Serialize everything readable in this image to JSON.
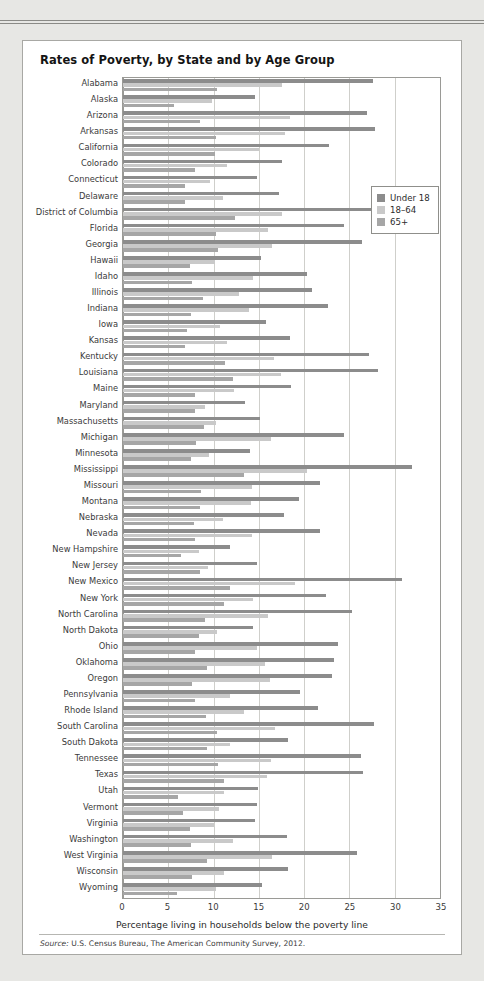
{
  "page": {
    "header_fragment": "",
    "card_title": "Rates of Poverty, by State and by Age Group",
    "source_prefix": "Source:",
    "source_text": " U.S. Census Bureau, The American Community Survey, 2012."
  },
  "legend": {
    "position": "top-right-inside",
    "items": [
      {
        "label": "Under 18",
        "color": "#8c8c8c",
        "key": "u18"
      },
      {
        "label": "18–64",
        "color": "#c9c9c9",
        "key": "a1864"
      },
      {
        "label": "65+",
        "color": "#a6a6a6",
        "key": "a65"
      }
    ]
  },
  "chart_data": {
    "type": "bar",
    "orientation": "horizontal",
    "title": "Rates of Poverty, by State and by Age Group",
    "xlabel": "Percentage living in households below the poverty line",
    "ylabel": "",
    "xlim": [
      0,
      35
    ],
    "xticks": [
      0,
      5,
      10,
      15,
      20,
      25,
      30,
      35
    ],
    "xtick_labels": [
      "0",
      "5",
      "10",
      "15",
      "20",
      "25",
      "30",
      "35"
    ],
    "grid": "vertical",
    "legend_position": "upper right",
    "categories": [
      "Alabama",
      "Alaska",
      "Arizona",
      "Arkansas",
      "California",
      "Colorado",
      "Connecticut",
      "Delaware",
      "District of Columbia",
      "Florida",
      "Georgia",
      "Hawaii",
      "Idaho",
      "Illinois",
      "Indiana",
      "Iowa",
      "Kansas",
      "Kentucky",
      "Louisiana",
      "Maine",
      "Maryland",
      "Massachusetts",
      "Michigan",
      "Minnesota",
      "Mississippi",
      "Missouri",
      "Montana",
      "Nebraska",
      "Nevada",
      "New Hampshire",
      "New Jersey",
      "New Mexico",
      "New York",
      "North Carolina",
      "North Dakota",
      "Ohio",
      "Oklahoma",
      "Oregon",
      "Pennsylvania",
      "Rhode Island",
      "South Carolina",
      "South Dakota",
      "Tennessee",
      "Texas",
      "Utah",
      "Vermont",
      "Virginia",
      "Washington",
      "West Virginia",
      "Wisconsin",
      "Wyoming"
    ],
    "series": [
      {
        "name": "Under 18",
        "color": "#8c8c8c",
        "values": [
          27.6,
          14.6,
          26.9,
          27.8,
          22.7,
          17.5,
          14.8,
          17.2,
          30.2,
          24.4,
          26.4,
          15.2,
          20.3,
          20.9,
          22.6,
          15.8,
          18.4,
          27.2,
          28.1,
          18.5,
          13.5,
          15.1,
          24.4,
          14.0,
          31.9,
          21.8,
          19.4,
          17.8,
          21.8,
          11.8,
          14.8,
          30.8,
          22.4,
          25.3,
          14.3,
          23.7,
          23.3,
          23.1,
          19.5,
          21.5,
          27.7,
          18.2,
          26.3,
          26.5,
          14.9,
          14.8,
          14.6,
          18.1,
          25.8,
          18.2,
          15.4
        ]
      },
      {
        "name": "18–64",
        "color": "#c9c9c9",
        "values": [
          17.5,
          9.8,
          18.4,
          17.9,
          15.0,
          11.5,
          9.6,
          11.0,
          17.5,
          16.0,
          16.5,
          10.2,
          14.3,
          12.8,
          13.9,
          10.7,
          11.5,
          16.7,
          17.4,
          12.3,
          9.1,
          10.3,
          16.3,
          9.5,
          20.3,
          14.2,
          14.1,
          11.0,
          14.2,
          8.4,
          9.4,
          19.0,
          14.3,
          16.0,
          10.4,
          14.8,
          15.7,
          16.2,
          11.8,
          13.4,
          16.8,
          11.8,
          16.3,
          15.9,
          11.2,
          10.6,
          10.1,
          12.2,
          16.5,
          11.2,
          10.3
        ]
      },
      {
        "name": "65+",
        "color": "#a6a6a6",
        "values": [
          10.4,
          5.6,
          8.5,
          10.3,
          10.2,
          7.9,
          6.9,
          6.8,
          12.4,
          10.3,
          10.5,
          7.4,
          7.6,
          8.8,
          7.5,
          7.1,
          6.9,
          11.3,
          12.1,
          8.0,
          7.9,
          8.9,
          8.1,
          7.5,
          13.4,
          8.6,
          8.5,
          7.8,
          7.9,
          6.4,
          8.5,
          11.8,
          11.2,
          9.0,
          8.4,
          7.9,
          9.3,
          7.6,
          8.0,
          9.2,
          10.4,
          9.3,
          10.5,
          11.1,
          6.1,
          6.6,
          7.4,
          7.5,
          9.3,
          7.6,
          6.0
        ]
      }
    ]
  }
}
